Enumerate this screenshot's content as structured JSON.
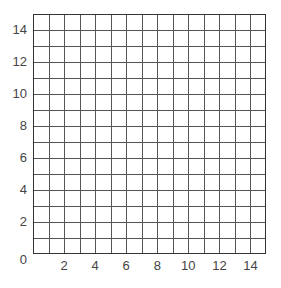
{
  "chart_data": {
    "type": "table",
    "title": "",
    "xlabel": "",
    "ylabel": "",
    "xlim": [
      0,
      15
    ],
    "ylim": [
      0,
      15
    ],
    "grid": true,
    "grid_step": 1,
    "origin_label": "0",
    "x_ticks": [
      "2",
      "4",
      "6",
      "8",
      "10",
      "12",
      "14"
    ],
    "y_ticks": [
      "2",
      "4",
      "6",
      "8",
      "10",
      "12",
      "14"
    ],
    "series": []
  },
  "colors": {
    "grid": "#555555",
    "border": "#333333",
    "label": "#444444"
  }
}
